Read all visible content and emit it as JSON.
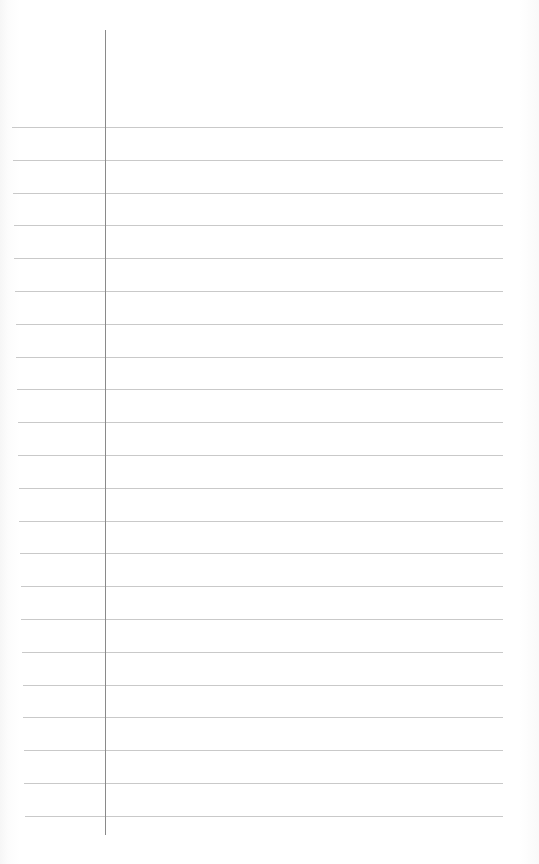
{
  "page": {
    "type": "lined-paper",
    "background_color": "#ffffff",
    "rule_color": "#c9c9c9",
    "margin_line_color": "#8a8a8a",
    "margin_line": {
      "x": 105,
      "top": 30,
      "bottom": 835
    },
    "rules": {
      "count": 22,
      "first_y": 127,
      "spacing": 32.8,
      "left_start_top": 12,
      "left_start_bottom": 25,
      "right_end": 503
    },
    "text": []
  }
}
